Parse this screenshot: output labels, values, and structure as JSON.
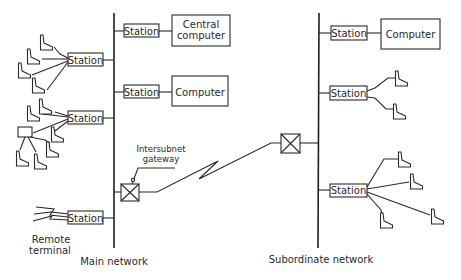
{
  "diagram": {
    "main_network": {
      "label": "Main network",
      "stations": [
        {
          "label": "Station",
          "connects_to": "Central computer"
        },
        {
          "label": "Station",
          "connects_to": "Computer"
        },
        {
          "label": "Station",
          "connects_to": "terminals (4)"
        },
        {
          "label": "Station",
          "connects_to": "terminals + cluster controller"
        },
        {
          "label": "Station",
          "connects_to": "Remote terminal"
        }
      ],
      "central_computer": {
        "line1": "Central",
        "line2": "computer"
      },
      "computer": "Computer",
      "remote_terminal": {
        "line1": "Remote",
        "line2": "terminal"
      }
    },
    "gateway": {
      "line1": "Intersubnet",
      "line2": "gateway"
    },
    "subordinate_network": {
      "label": "Subordinate network",
      "stations": [
        {
          "label": "Station",
          "connects_to": "Computer"
        },
        {
          "label": "Station",
          "connects_to": "terminals (2)"
        },
        {
          "label": "Station",
          "connects_to": "terminals (4)"
        }
      ],
      "computer": "Computer"
    }
  }
}
